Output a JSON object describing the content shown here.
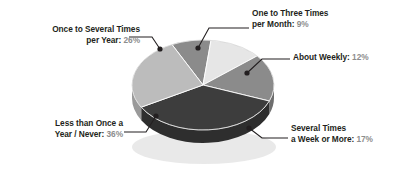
{
  "chart_data": {
    "type": "pie",
    "title": "",
    "subtitle": "",
    "xlabel": "",
    "ylabel": "",
    "legend_position": "callout-labels",
    "grid": false,
    "style": "3d-pie",
    "total_percent": 100,
    "categories": [
      "One to Three Times per Month",
      "About Weekly",
      "Several Times a Week or More",
      "Less than Once a Year / Never",
      "Once to Several Times per Year"
    ],
    "values": [
      9,
      12,
      17,
      36,
      26
    ],
    "slices": [
      {
        "id": "month",
        "label_line1": "One to Three Times",
        "label_line2": "per Month:",
        "value": 9,
        "value_text": "9%",
        "color": "#8b8b8b",
        "side_color": "#6e6e6e"
      },
      {
        "id": "weekly",
        "label_line1": "About Weekly:",
        "label_line2": "",
        "value": 12,
        "value_text": "12%",
        "color": "#e6e6e6",
        "side_color": "#bdbdbd"
      },
      {
        "id": "week-or-more",
        "label_line1": "Several Times",
        "label_line2": "a Week or More:",
        "value": 17,
        "value_text": "17%",
        "color": "#8b8b8b",
        "side_color": "#6e6e6e"
      },
      {
        "id": "never",
        "label_line1": "Less than Once a",
        "label_line2": "Year / Never:",
        "value": 36,
        "value_text": "36%",
        "color": "#3d3d3d",
        "side_color": "#2e2e2e"
      },
      {
        "id": "year",
        "label_line1": "Once to Several Times",
        "label_line2": "per Year:",
        "value": 26,
        "value_text": "26%",
        "color": "#bcbcbc",
        "side_color": "#9a9a9a"
      }
    ],
    "colors": {
      "background": "#ffffff",
      "label_text": "#231f20",
      "percent_text": "#8d8d8d",
      "leader_line": "#231f20",
      "shadow": "#d8d8d8"
    }
  }
}
